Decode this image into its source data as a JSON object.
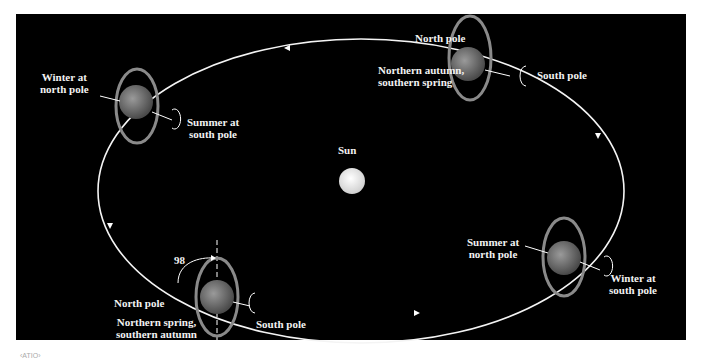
{
  "diagram": {
    "sun": {
      "label": "Sun"
    },
    "axial_tilt": {
      "label": "98"
    },
    "positions": [
      {
        "id": "left",
        "labels": {
          "a": "Winter at",
          "b": "north pole",
          "c": "Summer at",
          "d": "south pole"
        }
      },
      {
        "id": "top",
        "labels": {
          "north": "North pole",
          "season1": "Northern autumn,",
          "season2": "southern spring",
          "south": "South pole"
        }
      },
      {
        "id": "right",
        "labels": {
          "a": "Summer at",
          "b": "north pole",
          "c": "Winter at",
          "d": "south pole"
        }
      },
      {
        "id": "bottom",
        "labels": {
          "north": "North pole",
          "season1": "Northern spring,",
          "season2": "southern autumn",
          "south": "South pole"
        }
      }
    ],
    "footer": "‹ATIO›",
    "colors": {
      "background": "#000000",
      "orbit": "#ffffff",
      "planet": "#6f6f6f",
      "ring": "#8a8a8a",
      "sun": "#eeeeee"
    }
  }
}
